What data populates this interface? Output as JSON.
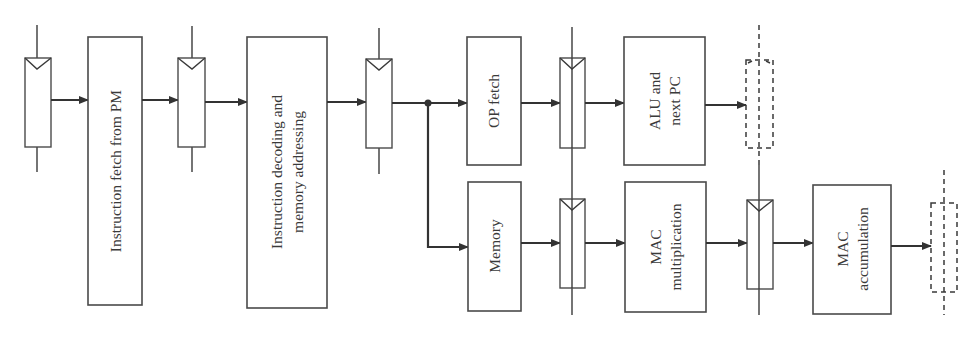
{
  "diagram": {
    "stages": {
      "fetch": {
        "label": "Instruction fetch from PM"
      },
      "decode": {
        "line1": "Instruction decoding and",
        "line2": "memory addressing"
      },
      "op_fetch": {
        "label": "OP fetch"
      },
      "alu": {
        "line1": "ALU and",
        "line2": "next PC"
      },
      "memory": {
        "label": "Memory"
      },
      "mac_mul": {
        "line1": "MAC",
        "line2": "multiplication"
      },
      "mac_acc": {
        "line1": "MAC",
        "line2": "accumulation"
      }
    },
    "registers": [
      {
        "id": "reg1",
        "style": "solid"
      },
      {
        "id": "reg2",
        "style": "solid"
      },
      {
        "id": "reg3",
        "style": "solid"
      },
      {
        "id": "reg4-top",
        "style": "solid"
      },
      {
        "id": "reg4-bottom",
        "style": "solid"
      },
      {
        "id": "reg5-top",
        "style": "dashed"
      },
      {
        "id": "reg5-bottom",
        "style": "solid"
      },
      {
        "id": "reg6",
        "style": "dashed"
      }
    ],
    "colors": {
      "stroke": "#3a3a3a",
      "background": "#ffffff",
      "text": "#3a3a3a"
    }
  }
}
